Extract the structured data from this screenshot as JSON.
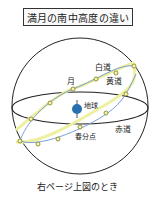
{
  "title": "満月の南中高度の違い",
  "labels": {
    "moon": "月",
    "moon_path": "白道",
    "ecliptic": "黄道",
    "earth": "地球",
    "equator": "赤道",
    "vernal_equinox": "春分点"
  },
  "caption": "右ページ上図のとき",
  "colors": {
    "outline": "#222222",
    "moon_path": "#7a9ed8",
    "ecliptic": "#eef0a0",
    "dot_fill": "#f7f3c0",
    "dot_stroke": "#8a8a20",
    "earth": "#2a6fb0"
  }
}
